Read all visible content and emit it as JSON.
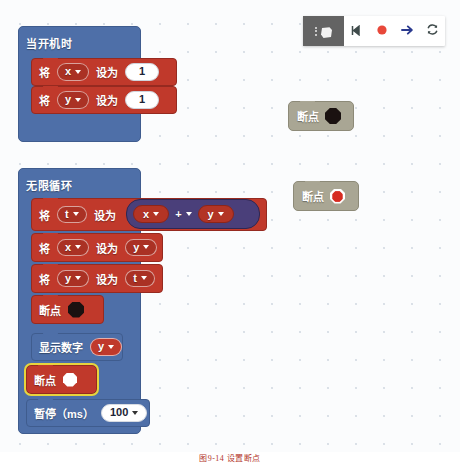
{
  "toolbar": {
    "menu_icon": "kebab-menu-icon",
    "logo_icon": "microbit-logo-icon",
    "step_label": "step-icon",
    "record_label": "record-icon",
    "run_label": "run-arrow-icon",
    "refresh_label": "refresh-icon",
    "accent_red": "#e8483a",
    "accent_blue": "#2b3a8f",
    "dark_bg": "#636363"
  },
  "workspace": {
    "onstart": {
      "title": "当开机时",
      "statements": [
        {
          "verb": "将",
          "variable": "x",
          "setto": "设为",
          "value": "1"
        },
        {
          "verb": "将",
          "variable": "y",
          "setto": "设为",
          "value": "1"
        }
      ]
    },
    "forever": {
      "title": "无限循环",
      "assign_t": {
        "verb": "将",
        "variable": "t",
        "setto": "设为"
      },
      "expression": {
        "left": "x",
        "operator": "+",
        "right": "y"
      },
      "assign_x": {
        "verb": "将",
        "variable": "x",
        "setto": "设为",
        "value": "y"
      },
      "assign_y": {
        "verb": "将",
        "variable": "y",
        "setto": "设为",
        "value": "t"
      },
      "breakpoint_inactive": {
        "label": "断点",
        "state": "black-octagon"
      },
      "show_number": {
        "label": "显示数字",
        "value": "y"
      },
      "breakpoint_selected": {
        "label": "断点",
        "state": "white-octagon-highlighted"
      },
      "pause": {
        "label": "暂停（ms）",
        "value": "100"
      }
    },
    "floating": [
      {
        "label": "断点",
        "state": "black-octagon"
      },
      {
        "label": "断点",
        "state": "red-octagon"
      }
    ]
  },
  "caption": {
    "text": "图9-14 设置断点"
  },
  "colors": {
    "hat_blue": "#4e6fa8",
    "statement_red": "#c0392b",
    "reporter_purple": "#4a3f7a",
    "highlight_yellow": "#e8d43c",
    "ghost_gray": "#a9a694",
    "canvas_bg": "#fbfcfd"
  }
}
